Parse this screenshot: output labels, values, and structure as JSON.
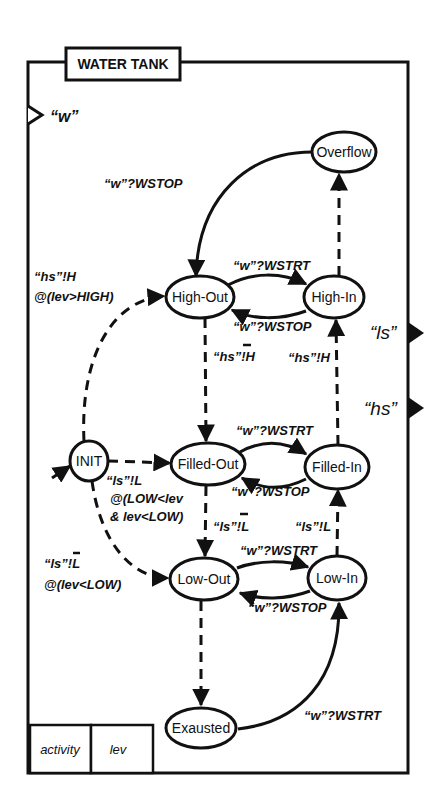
{
  "diagram": {
    "title": "WATER TANK",
    "frame": {
      "x": 28,
      "y": 62,
      "width": 380,
      "height": 711
    },
    "title_box": {
      "x": 66,
      "y": 48,
      "width": 114,
      "height": 32
    },
    "ports": [
      {
        "id": "w",
        "label": "“w”",
        "side": "left",
        "direction": "in",
        "y": 115,
        "label_x": 48,
        "label_y": 122
      },
      {
        "id": "ls",
        "label": "“ls”",
        "side": "right",
        "direction": "out",
        "y": 333,
        "label_x": 372,
        "label_y": 338
      },
      {
        "id": "hs",
        "label": "“hs”",
        "side": "right",
        "direction": "out",
        "y": 408,
        "label_x": 366,
        "label_y": 415
      }
    ],
    "attributes": [
      {
        "label": "activity",
        "x": 30,
        "width": 61
      },
      {
        "label": "lev",
        "x": 91,
        "width": 62
      }
    ],
    "attribute_row": {
      "y": 725,
      "height": 48
    },
    "states": [
      {
        "id": "overflow",
        "label": "Overflow",
        "cx": 344,
        "cy": 152,
        "rx": 32,
        "ry": 20
      },
      {
        "id": "high-out",
        "label": "High-Out",
        "cx": 200,
        "cy": 297,
        "rx": 34,
        "ry": 21
      },
      {
        "id": "high-in",
        "label": "High-In",
        "cx": 332,
        "cy": 297,
        "rx": 30,
        "ry": 21
      },
      {
        "id": "init",
        "label": "INIT",
        "cx": 89,
        "cy": 461,
        "rx": 19,
        "ry": 20
      },
      {
        "id": "filled-out",
        "label": "Filled-Out",
        "cx": 210,
        "cy": 464,
        "rx": 37,
        "ry": 21
      },
      {
        "id": "filled-in",
        "label": "Filled-In",
        "cx": 336,
        "cy": 467,
        "rx": 32,
        "ry": 22
      },
      {
        "id": "low-out",
        "label": "Low-Out",
        "cx": 205,
        "cy": 579,
        "rx": 34,
        "ry": 21
      },
      {
        "id": "low-in",
        "label": "Low-In",
        "cx": 336,
        "cy": 578,
        "rx": 29,
        "ry": 22
      },
      {
        "id": "exausted",
        "label": "Exausted",
        "cx": 201,
        "cy": 728,
        "rx": 35,
        "ry": 20
      }
    ],
    "transitions": [
      {
        "id": "overflow-to-highout",
        "from": "overflow",
        "to": "high-out",
        "style": "solid",
        "label": "“w”?WSTOP",
        "label_x": 85,
        "label_y": 178
      },
      {
        "id": "highin-to-overflow",
        "from": "high-in",
        "to": "overflow",
        "style": "dashed",
        "label": "",
        "label_x": 0,
        "label_y": 0
      },
      {
        "id": "highout-to-highin",
        "from": "high-out",
        "to": "high-in",
        "style": "solid",
        "label": "“w”?WSTRT",
        "label_x": 233,
        "label_y": 271
      },
      {
        "id": "highin-to-highout",
        "from": "high-in",
        "to": "high-out",
        "style": "solid",
        "label": "“w”?WSTOP",
        "label_x": 233,
        "label_y": 328
      },
      {
        "id": "init-to-highout",
        "from": "init",
        "to": "high-out",
        "style": "dashed",
        "label": "“hs”!H",
        "label2": "@(lev>HIGH)",
        "label_x": 32,
        "label_y": 282
      },
      {
        "id": "highout-to-filledout",
        "from": "high-out",
        "to": "filled-out",
        "style": "dashed",
        "label": "“hs”!H",
        "overbar": true,
        "label_x": 213,
        "label_y": 360
      },
      {
        "id": "filledin-to-highin",
        "from": "filled-in",
        "to": "high-in",
        "style": "dashed",
        "label": "“hs”!H",
        "label_x": 290,
        "label_y": 370
      },
      {
        "id": "init-to-filledout",
        "from": "init",
        "to": "filled-out",
        "style": "dashed",
        "label": "“ls”!L",
        "label2": "@(LOW<lev",
        "label3": "& lev<LOW)",
        "label_x": 105,
        "label_y": 490
      },
      {
        "id": "filledout-to-filledin",
        "from": "filled-out",
        "to": "filled-in",
        "style": "solid",
        "label": "“w”?WSTRT",
        "label_x": 233,
        "label_y": 437
      },
      {
        "id": "filledin-to-filledout",
        "from": "filled-in",
        "to": "filled-out",
        "style": "solid",
        "label": "“w”?WSTOP",
        "label_x": 231,
        "label_y": 496
      },
      {
        "id": "filledout-to-lowout",
        "from": "filled-out",
        "to": "low-out",
        "style": "dashed",
        "label": "“ls”!L",
        "overbar": true,
        "label_x": 213,
        "label_y": 531
      },
      {
        "id": "lowin-to-filledin",
        "from": "low-in",
        "to": "filled-in",
        "style": "dashed",
        "label": "“ls”!L",
        "label_x": 295,
        "label_y": 531
      },
      {
        "id": "init-to-lowout",
        "from": "init",
        "to": "low-out",
        "style": "dashed",
        "label": "“ls”!L",
        "overbar": true,
        "label2": "@(lev<LOW)",
        "label_x": 44,
        "label_y": 573
      },
      {
        "id": "lowout-to-lowin",
        "from": "low-out",
        "to": "low-in",
        "style": "solid",
        "label": "“w”?WSTRT",
        "label_x": 240,
        "label_y": 555
      },
      {
        "id": "lowin-to-lowout",
        "from": "low-in",
        "to": "low-out",
        "style": "solid",
        "label": "“w”?WSTOP",
        "label_x": 248,
        "label_y": 608
      },
      {
        "id": "lowout-to-exausted",
        "from": "low-out",
        "to": "exausted",
        "style": "dashed",
        "label": "",
        "label_x": 0,
        "label_y": 0
      },
      {
        "id": "exausted-to-lowin",
        "from": "exausted",
        "to": "low-in",
        "style": "solid",
        "label": "“w”?WSTRT",
        "label_x": 302,
        "label_y": 720
      },
      {
        "id": "entry-to-init",
        "from": "entry",
        "to": "init",
        "style": "solid",
        "label": "",
        "label_x": 0,
        "label_y": 0
      }
    ]
  }
}
